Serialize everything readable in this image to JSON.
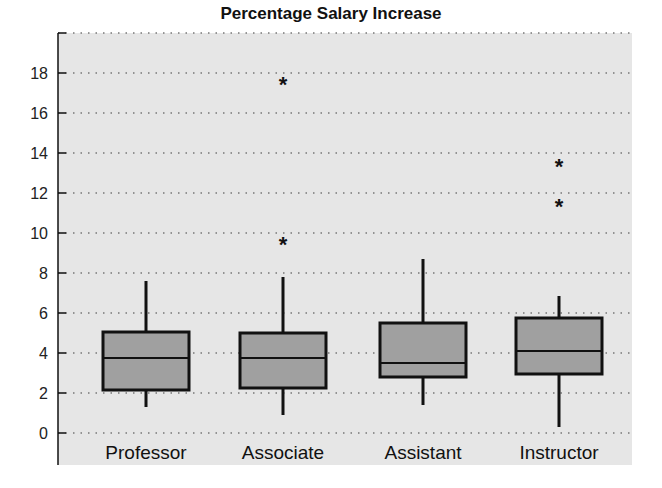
{
  "chart_data": {
    "type": "boxplot",
    "title": "Percentage Salary Increase",
    "xlabel": "",
    "ylabel": "",
    "ylim": [
      -1.6,
      20
    ],
    "yticks": [
      0,
      2,
      4,
      6,
      8,
      10,
      12,
      14,
      16,
      18
    ],
    "grid": "horizontal dotted",
    "categories": [
      "Professor",
      "Associate",
      "Assistant",
      "Instructor"
    ],
    "boxes": [
      {
        "name": "Professor",
        "whisker_low": 1.3,
        "q1": 2.15,
        "median": 3.75,
        "q3": 5.05,
        "whisker_high": 7.6,
        "outliers": []
      },
      {
        "name": "Associate",
        "whisker_low": 0.9,
        "q1": 2.25,
        "median": 3.75,
        "q3": 5.0,
        "whisker_high": 7.8,
        "outliers": [
          9.6,
          17.6
        ]
      },
      {
        "name": "Assistant",
        "whisker_low": 1.4,
        "q1": 2.8,
        "median": 3.5,
        "q3": 5.5,
        "whisker_high": 8.7,
        "outliers": []
      },
      {
        "name": "Instructor",
        "whisker_low": 0.3,
        "q1": 2.95,
        "median": 4.1,
        "q3": 5.75,
        "whisker_high": 6.85,
        "outliers": [
          11.5,
          13.5
        ]
      }
    ],
    "colors": {
      "box_fill": "#a0a0a0",
      "plot_background": "#e6e6e6",
      "grid": "#777777",
      "lines": "#111111"
    }
  }
}
